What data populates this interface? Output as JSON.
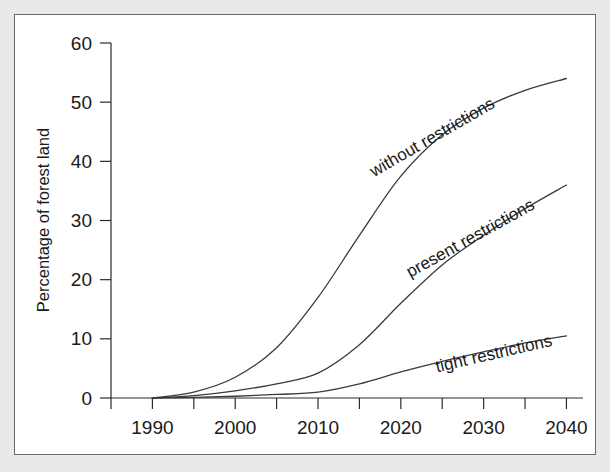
{
  "chart_data": {
    "type": "line",
    "title": "",
    "xlabel": "",
    "ylabel": "Percentage of forest land",
    "xlim": [
      1985,
      2042
    ],
    "ylim": [
      0,
      60
    ],
    "grid": false,
    "legend_position": "inline-curve-labels",
    "x_tick_labels": [
      "1990",
      "2000",
      "2010",
      "2020",
      "2030",
      "2040"
    ],
    "x_ticks_major": [
      1990,
      2000,
      2010,
      2020,
      2030,
      2040
    ],
    "x_ticks_minor": [
      1985,
      1995,
      2005,
      2015,
      2025,
      2035
    ],
    "y_tick_labels": [
      "0",
      "10",
      "20",
      "30",
      "40",
      "50",
      "60"
    ],
    "y_ticks": [
      0,
      10,
      20,
      30,
      40,
      50,
      60
    ],
    "x": [
      1990,
      1995,
      2000,
      2005,
      2010,
      2015,
      2020,
      2025,
      2030,
      2035,
      2040
    ],
    "series": [
      {
        "name": "without restrictions",
        "label": "without restrictions",
        "values": [
          0,
          1.0,
          3.5,
          8.5,
          17.0,
          27.5,
          37.5,
          44.5,
          49.0,
          52.0,
          54.0
        ]
      },
      {
        "name": "present restrictions",
        "label": "present restrictions",
        "values": [
          0,
          0.4,
          1.2,
          2.4,
          4.2,
          9.0,
          16.0,
          22.5,
          27.5,
          32.0,
          36.0
        ]
      },
      {
        "name": "tight restrictions",
        "label": "tight restrictions",
        "values": [
          0,
          0.1,
          0.3,
          0.6,
          1.0,
          2.4,
          4.4,
          6.2,
          7.8,
          9.3,
          10.5
        ]
      }
    ]
  },
  "curve_labels": [
    {
      "text": "without restrictions",
      "x": 420,
      "y": 127,
      "rotation": -30
    },
    {
      "text": "present restrictions",
      "x": 458,
      "y": 228,
      "rotation": -29
    },
    {
      "text": "tight restrictions",
      "x": 480,
      "y": 344,
      "rotation": -13
    }
  ],
  "colors": {
    "background": "#e9e9e9",
    "panel": "#ffffff",
    "frame_border": "#6a6a6a",
    "axis": "#2b2b2b",
    "line": "#3a3a3a",
    "text": "#1a1a1a"
  }
}
